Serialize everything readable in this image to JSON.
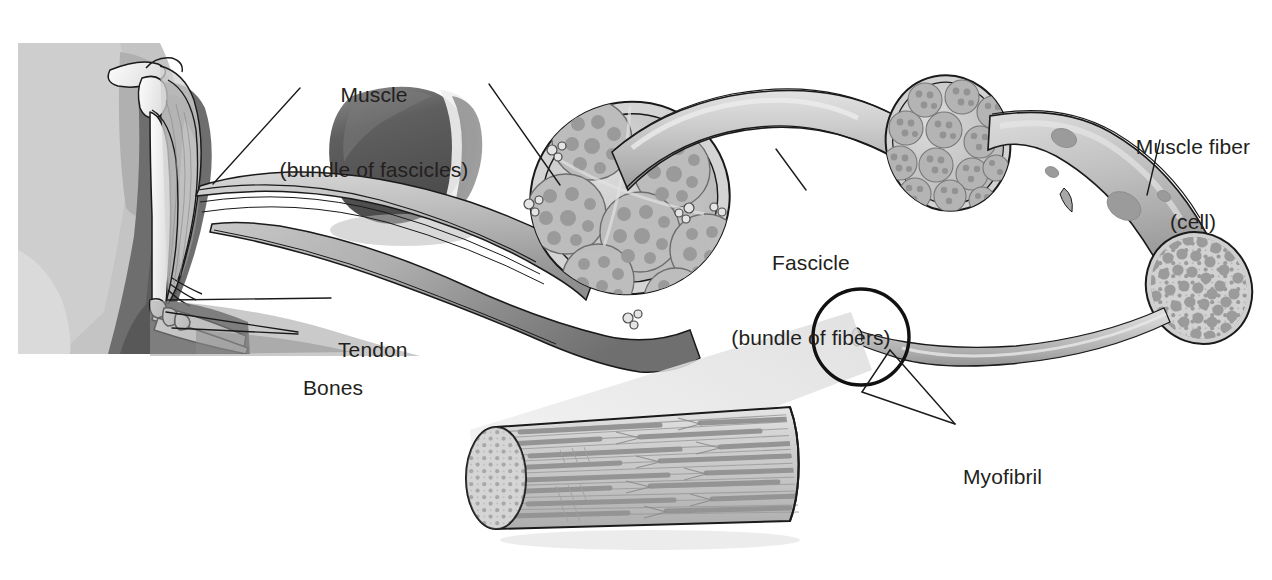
{
  "figure": {
    "background_color": "#ffffff",
    "text_color": "#231f20",
    "ink_color": "#1a1a1a"
  },
  "labels": [
    {
      "name": "muscle",
      "line1": "Muscle",
      "line2": "(bundle of fascicles)",
      "x": 268,
      "y": 32,
      "width": 212,
      "align": "center"
    },
    {
      "name": "muscle-fiber",
      "line1": "Muscle fiber",
      "line2": "(cell)",
      "x": 1124,
      "y": 84,
      "width": 140,
      "align": "center"
    },
    {
      "name": "fascicle",
      "line1": "Fascicle",
      "line2": "(bundle of fibers)",
      "x": 723,
      "y": 200,
      "width": 175,
      "align": "center"
    },
    {
      "name": "tendon",
      "line1": "Tendon",
      "line2": "",
      "x": 338,
      "y": 288,
      "width": 90,
      "align": "left"
    },
    {
      "name": "bones",
      "line1": "Bones",
      "line2": "",
      "x": 303,
      "y": 326,
      "width": 80,
      "align": "left"
    },
    {
      "name": "myofibril",
      "line1": "Myofibril",
      "line2": "",
      "x": 963,
      "y": 415,
      "width": 110,
      "align": "left"
    }
  ],
  "structures": [
    {
      "name": "arm-photo",
      "kind": "grayscale-photo",
      "description": "flexed arm with skeletal and biceps overlay"
    },
    {
      "name": "dissected-muscle-photo",
      "kind": "grayscale-photo",
      "description": "dark muscle belly specimen"
    },
    {
      "name": "muscle-cross-section",
      "kind": "cross-section",
      "fascicle_count": 7
    },
    {
      "name": "fascicle-strand",
      "kind": "tube"
    },
    {
      "name": "fascicle-cross-section",
      "kind": "cross-section",
      "fiber_count": 13
    },
    {
      "name": "muscle-fiber-strand",
      "kind": "tube",
      "nuclei": 4
    },
    {
      "name": "muscle-fiber-cross-section",
      "kind": "cross-section",
      "myofibril_count": 60
    },
    {
      "name": "myofibril-strand",
      "kind": "tube"
    },
    {
      "name": "magnifier-circle",
      "kind": "callout-circle"
    },
    {
      "name": "magnification-cone",
      "kind": "wedge"
    },
    {
      "name": "myofibril-cylinder",
      "kind": "cylinder",
      "description": "sarcomere filaments with dotted end face"
    }
  ],
  "palette": {
    "tissue_light": "#d9d9d9",
    "tissue_mid": "#c0c0c0",
    "tissue_dark": "#9a9a9a",
    "photo_dark": "#5c5c5c",
    "photo_mid": "#9d9d9d",
    "photo_light": "#cfcfcf",
    "outline": "#1a1a1a",
    "cone": "#ececec"
  }
}
